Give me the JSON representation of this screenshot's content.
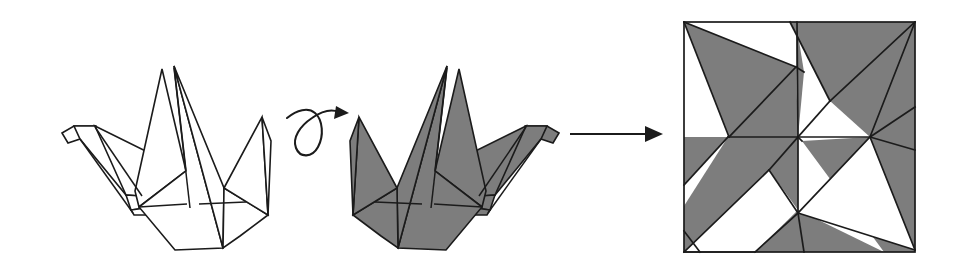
{
  "page": {
    "title": "Origami crane folding sequence",
    "background_color": "#ffffff",
    "width": 959,
    "height": 271
  },
  "palette": {
    "ink": "#1b1b1b",
    "paper_front": "#ffffff",
    "paper_back": "#7d7d7d",
    "background": "#ffffff"
  },
  "steps": [
    {
      "id": "step-1",
      "name": "crane-white-side",
      "caption": "",
      "fill": "#ffffff",
      "description": "Folded paper crane, white side up, head pointing left"
    },
    {
      "id": "step-2",
      "name": "crane-gray-side",
      "caption": "",
      "fill": "#7d7d7d",
      "description": "Same crane turned over, shaded side up, head pointing right"
    },
    {
      "id": "step-3",
      "name": "crease-pattern",
      "caption": "",
      "description": "Unfolded square crease pattern with alternating shaded and white triangular facets"
    }
  ],
  "arrows": [
    {
      "id": "arrow-turn-over",
      "name": "turn-over-arrow",
      "symbol": "loop-arrow",
      "label": "",
      "meaning": "turn over",
      "from_step": "step-1",
      "to_step": "step-2"
    },
    {
      "id": "arrow-unfold",
      "name": "unfold-arrow",
      "symbol": "straight-arrow-right",
      "label": "",
      "meaning": "unfold",
      "from_step": "step-2",
      "to_step": "step-3"
    }
  ],
  "crease_pattern": {
    "name": "crane-crease-pattern",
    "square": {
      "x": 684,
      "y": 22,
      "width": 231,
      "height": 230
    },
    "symmetry": "180-degree rotational",
    "facet_count": 16,
    "shaded_color": "#7d7d7d",
    "unshaded_color": "#ffffff"
  }
}
